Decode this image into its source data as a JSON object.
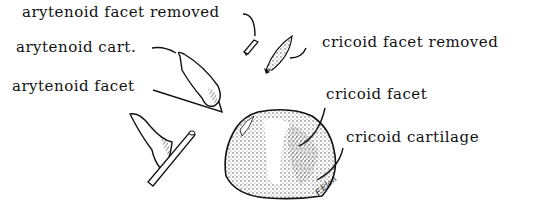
{
  "diagram": {
    "labels": {
      "arytenoid_facet_removed": "arytenoid facet removed",
      "arytenoid_cart": "arytenoid cart.",
      "arytenoid_facet": "arytenoid facet",
      "cricoid_facet_removed": "cricoid facet removed",
      "cricoid_facet": "cricoid facet",
      "cricoid_cartilage": "cricoid cartilage"
    },
    "signature": "F.Elon"
  }
}
